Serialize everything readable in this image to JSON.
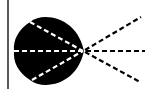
{
  "diagram": {
    "colors": {
      "background": "#ffffff",
      "shape": "#000000",
      "ray_outside": "#000000",
      "ray_inside": "#ffffff",
      "border": "#222222"
    },
    "focal_point": [
      83,
      51
    ],
    "rays": [
      {
        "name": "upper",
        "from": [
          30,
          22
        ],
        "to": [
          141,
          17
        ]
      },
      {
        "name": "middle",
        "from": [
          14,
          51
        ],
        "to": [
          145,
          51
        ]
      },
      {
        "name": "lower",
        "from": [
          32,
          80
        ],
        "to": [
          140,
          82
        ]
      }
    ]
  }
}
